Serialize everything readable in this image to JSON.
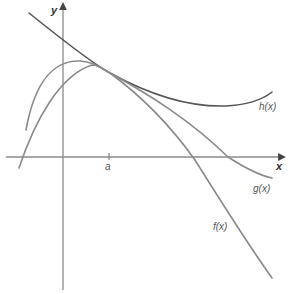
{
  "figure": {
    "axes": {
      "x_label": "x",
      "y_label": "y",
      "tick_label": "a"
    },
    "curves": [
      {
        "name": "h",
        "label": "h(x)",
        "color": "#555555"
      },
      {
        "name": "g",
        "label": "g(x)",
        "color": "#8a8a8a"
      },
      {
        "name": "f",
        "label": "f(x)",
        "color": "#8a8a8a"
      }
    ]
  }
}
